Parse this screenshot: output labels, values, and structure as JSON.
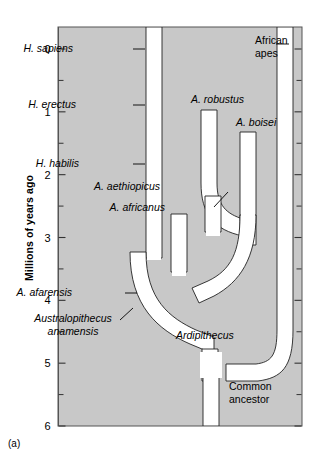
{
  "figure": {
    "caption": "(a)",
    "panel_bg_color": "#c8c8c8",
    "branch_color": "#ffffff",
    "outline_color": "#000000"
  },
  "axis": {
    "title": "Millions of years ago",
    "unit": "Millions of years ago",
    "tick_labels": [
      "0",
      "1",
      "2",
      "3",
      "4",
      "5",
      "6"
    ],
    "tick_values": [
      0,
      1,
      2,
      3,
      4,
      5,
      6
    ],
    "minor_tick_values": [
      0.5,
      1.5,
      2.5,
      3.5,
      4.5,
      5.5
    ],
    "range": [
      0,
      6
    ],
    "direction": "top-to-bottom"
  },
  "taxa": [
    {
      "id": "h-sapiens",
      "label": "H. sapiens",
      "side": "left",
      "italic": true,
      "label_x": 73,
      "label_y": 52,
      "leader": true
    },
    {
      "id": "h-erectus",
      "label": "H. erectus",
      "side": "left",
      "italic": true,
      "label_x": 76,
      "label_y": 108,
      "leader": true
    },
    {
      "id": "h-habilis",
      "label": "H. habilis",
      "side": "left",
      "italic": true,
      "label_x": 79,
      "label_y": 167,
      "leader": true
    },
    {
      "id": "a-robustus",
      "label": "A. robustus",
      "side": "top",
      "italic": true,
      "label_x": 191,
      "label_y": 103,
      "leader": false
    },
    {
      "id": "a-boisei",
      "label": "A. boisei",
      "side": "top",
      "italic": true,
      "label_x": 236,
      "label_y": 126,
      "leader": false
    },
    {
      "id": "a-aethiopicus",
      "label": "A. aethiopicus",
      "side": "left",
      "italic": true,
      "label_x": 160,
      "label_y": 190,
      "leader": true
    },
    {
      "id": "a-africanus",
      "label": "A. africanus",
      "side": "left",
      "italic": true,
      "label_x": 165,
      "label_y": 211,
      "leader": true
    },
    {
      "id": "a-afarensis",
      "label": "A. afarensis",
      "side": "left",
      "italic": true,
      "label_x": 72,
      "label_y": 296,
      "leader": true
    },
    {
      "id": "a-anamensis",
      "label": "Australopithecus anamensis",
      "side": "left",
      "italic": true,
      "label_x": 73,
      "label_y": 322,
      "leader": true
    },
    {
      "id": "ardipithecus",
      "label": "Ardipithecus",
      "side": "right",
      "italic": true,
      "label_x": 176,
      "label_y": 339,
      "leader": false
    },
    {
      "id": "african-apes",
      "label": "African apes",
      "side": "right",
      "italic": false,
      "label_x": 255,
      "label_y": 44,
      "leader": true
    },
    {
      "id": "common-ancestor",
      "label": "Common ancestor",
      "side": "right",
      "italic": false,
      "label_x": 229,
      "label_y": 390,
      "leader": false
    }
  ],
  "labels": {
    "h_sapiens": "H. sapiens",
    "h_erectus": "H. erectus",
    "h_habilis": "H. habilis",
    "a_robustus": "A. robustus",
    "a_boisei": "A. boisei",
    "a_aethiopicus": "A. aethiopicus",
    "a_africanus": "A. africanus",
    "a_afarensis": "A. afarensis",
    "australopithecus_line1": "Australopithecus",
    "australopithecus_line2": "anamensis",
    "ardipithecus": "Ardipithecus",
    "african_apes_line1": "African",
    "african_apes_line2": "apes",
    "common_ancestor_line1": "Common",
    "common_ancestor_line2": "ancestor"
  },
  "chart_data": {
    "type": "diagram",
    "subtype": "phylogenetic-tree",
    "ylabel": "Millions of years ago",
    "ylim": [
      0,
      6
    ],
    "y_inverted": true,
    "branches": [
      {
        "name": "Homo lineage",
        "top_mya": 0.0,
        "bottom_mya": 3.4
      },
      {
        "name": "A. robustus",
        "top_mya": 1.0,
        "bottom_mya": 2.05
      },
      {
        "name": "A. boisei",
        "top_mya": 1.25,
        "bottom_mya": 2.6
      },
      {
        "name": "A. aethiopicus",
        "top_mya": 2.35,
        "bottom_mya": 2.6
      },
      {
        "name": "A. africanus",
        "top_mya": 2.6,
        "bottom_mya": 2.95
      },
      {
        "name": "A. afarensis",
        "top_mya": 2.95,
        "bottom_mya": 4.4
      },
      {
        "name": "Ardipithecus",
        "top_mya": 4.4,
        "bottom_mya": 4.95
      },
      {
        "name": "African apes",
        "top_mya": 0.0,
        "bottom_mya": 5.0
      },
      {
        "name": "Common ancestor stem",
        "top_mya": 4.95,
        "bottom_mya": 6.0
      }
    ]
  }
}
